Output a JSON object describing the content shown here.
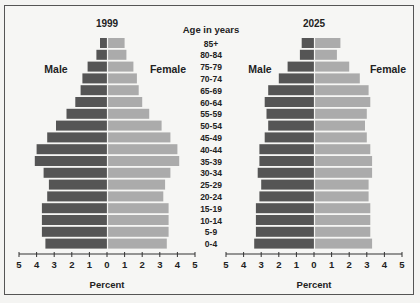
{
  "chart_data": [
    {
      "type": "bar",
      "orientation": "horizontal-population-pyramid",
      "title": "1999",
      "xlabel": "Percent",
      "categories_label": "Age in years",
      "categories": [
        "85+",
        "80-84",
        "75-79",
        "70-74",
        "65-69",
        "60-64",
        "55-59",
        "50-54",
        "45-49",
        "40-44",
        "35-39",
        "30-34",
        "25-29",
        "20-24",
        "15-19",
        "10-14",
        "5-9",
        "0-4"
      ],
      "series": [
        {
          "name": "Male",
          "color": "#555555",
          "values": [
            0.4,
            0.6,
            1.1,
            1.4,
            1.5,
            1.8,
            2.3,
            2.9,
            3.4,
            4.0,
            4.1,
            3.6,
            3.3,
            3.4,
            3.7,
            3.7,
            3.7,
            3.5
          ]
        },
        {
          "name": "Female",
          "color": "#ababab",
          "values": [
            1.0,
            1.1,
            1.5,
            1.7,
            1.8,
            2.0,
            2.4,
            3.1,
            3.6,
            4.0,
            4.1,
            3.6,
            3.3,
            3.2,
            3.5,
            3.5,
            3.5,
            3.4
          ]
        }
      ],
      "xlim": [
        -5,
        5
      ],
      "xticks": [
        5,
        4,
        3,
        2,
        1,
        0,
        1,
        2,
        3,
        4,
        5
      ],
      "legend": {
        "male_label": "Male",
        "female_label": "Female"
      }
    },
    {
      "type": "bar",
      "orientation": "horizontal-population-pyramid",
      "title": "2025",
      "xlabel": "Percent",
      "categories_label": "Age in years",
      "categories": [
        "85+",
        "80-84",
        "75-79",
        "70-74",
        "65-69",
        "60-64",
        "55-59",
        "50-54",
        "45-49",
        "40-44",
        "35-39",
        "30-34",
        "25-29",
        "20-24",
        "15-19",
        "10-14",
        "5-9",
        "0-4"
      ],
      "series": [
        {
          "name": "Male",
          "color": "#555555",
          "values": [
            0.7,
            0.8,
            1.5,
            2.0,
            2.6,
            2.8,
            2.7,
            2.6,
            2.8,
            3.1,
            3.1,
            3.2,
            3.0,
            3.1,
            3.3,
            3.3,
            3.3,
            3.4
          ]
        },
        {
          "name": "Female",
          "color": "#ababab",
          "values": [
            1.5,
            1.3,
            2.0,
            2.6,
            3.1,
            3.2,
            3.0,
            2.9,
            3.0,
            3.2,
            3.3,
            3.3,
            3.1,
            3.1,
            3.2,
            3.2,
            3.2,
            3.3
          ]
        }
      ],
      "xlim": [
        -5,
        5
      ],
      "xticks": [
        5,
        4,
        3,
        2,
        1,
        0,
        1,
        2,
        3,
        4,
        5
      ],
      "legend": {
        "male_label": "Male",
        "female_label": "Female"
      }
    }
  ],
  "age_axis_title": "Age in years"
}
